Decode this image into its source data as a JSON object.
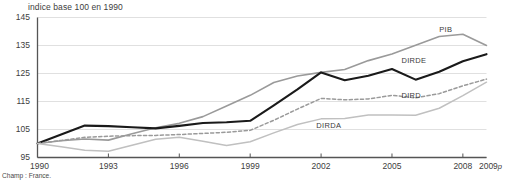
{
  "chart_data": {
    "type": "line",
    "title": "indice base 100 en 1990",
    "xlabel": "",
    "ylabel": "",
    "ylim": [
      95,
      145
    ],
    "xlim": [
      1990,
      2009
    ],
    "grid": true,
    "legend_position": "inline-annotations",
    "yticks": [
      95,
      105,
      115,
      125,
      135,
      145
    ],
    "ytick_labels": [
      "95",
      "105",
      "115",
      "125",
      "135",
      "145"
    ],
    "xticks": [
      1990,
      1993,
      1996,
      1999,
      2002,
      2005,
      2008,
      2009
    ],
    "xtick_labels": [
      "1990",
      "1993",
      "1996",
      "1999",
      "2002",
      "2005",
      "2008",
      "2009p"
    ],
    "x": [
      1990,
      1991,
      1992,
      1993,
      1994,
      1995,
      1996,
      1997,
      1998,
      1999,
      2000,
      2001,
      2002,
      2003,
      2004,
      2005,
      2006,
      2007,
      2008,
      2009
    ],
    "series": [
      {
        "name": "PIB",
        "color": "#9a9a9a",
        "style": "solid",
        "width": 1.6,
        "label_x": 2007.0,
        "label_y": 140.5,
        "values": [
          100.0,
          101.0,
          101.6,
          101.2,
          103.5,
          105.6,
          107.2,
          109.6,
          113.4,
          117.2,
          121.8,
          124.1,
          125.4,
          126.4,
          129.6,
          132.0,
          135.1,
          138.2,
          139.0,
          135.0
        ]
      },
      {
        "name": "DIRDE",
        "color": "#1a1a1a",
        "style": "solid",
        "width": 2.1,
        "label_x": 2005.4,
        "label_y": 129.5,
        "values": [
          100.0,
          103.2,
          106.4,
          106.2,
          105.8,
          105.4,
          106.3,
          107.3,
          107.6,
          108.1,
          113.6,
          119.3,
          125.4,
          122.6,
          124.2,
          126.6,
          122.8,
          125.6,
          129.4,
          131.9
        ]
      },
      {
        "name": "DIRD",
        "color": "#9a9a9a",
        "style": "dashed",
        "width": 1.5,
        "label_x": 2005.4,
        "label_y": 117.0,
        "values": [
          100.0,
          101.1,
          102.2,
          102.6,
          102.8,
          102.9,
          103.2,
          103.6,
          104.0,
          104.7,
          108.3,
          112.3,
          116.1,
          115.6,
          115.9,
          117.2,
          116.3,
          117.8,
          120.6,
          123.0
        ]
      },
      {
        "name": "DIRDA",
        "color": "#c0c0c0",
        "style": "solid",
        "width": 1.5,
        "label_x": 2001.8,
        "label_y": 106.3,
        "values": [
          100.0,
          98.8,
          97.6,
          97.2,
          99.4,
          101.5,
          102.2,
          100.8,
          99.3,
          100.6,
          103.8,
          106.8,
          108.8,
          108.9,
          110.2,
          110.2,
          110.1,
          112.6,
          117.1,
          121.9
        ]
      }
    ]
  },
  "footnote": "Champ : France."
}
